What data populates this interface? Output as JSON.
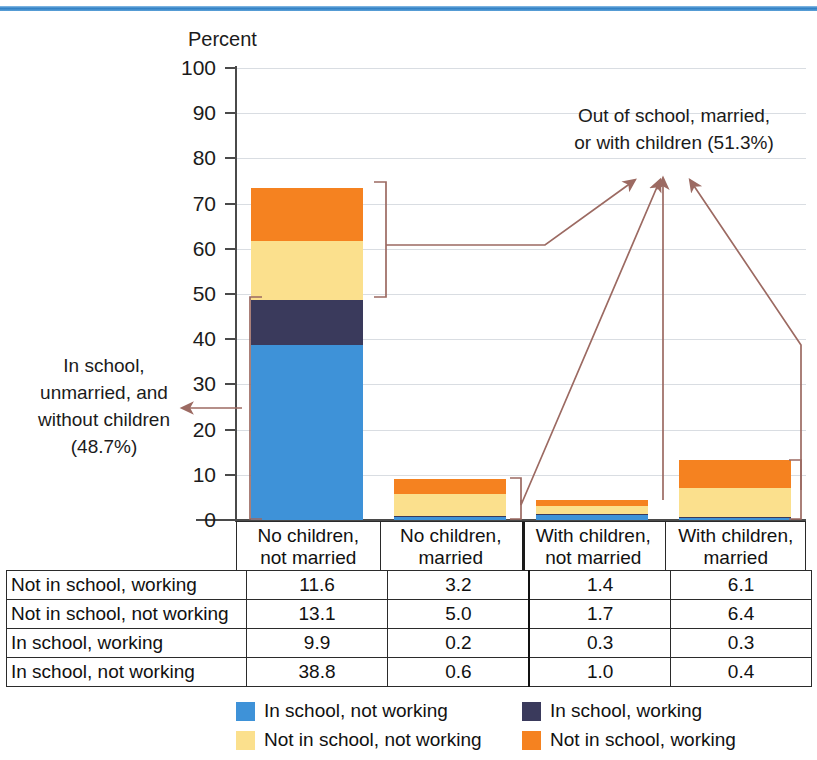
{
  "chart_data": {
    "type": "bar",
    "subtype": "stacked-bar",
    "title": "",
    "ylabel": "Percent",
    "xlabel": "",
    "ylim": [
      0,
      100
    ],
    "yticks": [
      0,
      10,
      20,
      30,
      40,
      50,
      60,
      70,
      80,
      90,
      100
    ],
    "grid": true,
    "legend_position": "bottom",
    "categories": [
      "No children, not married",
      "No children, married",
      "With children, not married",
      "With children, married"
    ],
    "series": [
      {
        "name": "In school, not working",
        "color": "#3e92d8",
        "values": [
          38.8,
          0.6,
          1.0,
          0.4
        ]
      },
      {
        "name": "In school, working",
        "color": "#3a3a5c",
        "values": [
          9.9,
          0.2,
          0.3,
          0.3
        ]
      },
      {
        "name": "Not in school, not working",
        "color": "#fbe08d",
        "values": [
          13.1,
          5.0,
          1.7,
          6.4
        ]
      },
      {
        "name": "Not in school, working",
        "color": "#f58220",
        "values": [
          11.6,
          3.2,
          1.4,
          6.1
        ]
      }
    ],
    "totals": [
      73.4,
      9.0,
      4.4,
      13.2
    ],
    "annotations": [
      "In school, unmarried, and without children (48.7%)",
      "Out of school, married, or with children (51.3%)"
    ]
  },
  "axis": {
    "title": "Percent",
    "ticks": [
      "100",
      "90",
      "80",
      "70",
      "60",
      "50",
      "40",
      "30",
      "20",
      "10",
      "0"
    ]
  },
  "categories": [
    {
      "line1": "No children,",
      "line2": "not married"
    },
    {
      "line1": "No children,",
      "line2": "married"
    },
    {
      "line1": "With children,",
      "line2": "not married"
    },
    {
      "line1": "With children,",
      "line2": "married"
    }
  ],
  "annotations": {
    "left": {
      "line1": "In school,",
      "line2": "unmarried, and",
      "line3": "without children",
      "line4": "(48.7%)"
    },
    "right": {
      "line1": "Out of school, married,",
      "line2": "or with children (51.3%)"
    }
  },
  "table": {
    "rows": [
      {
        "label": "Not in school, working",
        "values": [
          "11.6",
          "3.2",
          "1.4",
          "6.1"
        ]
      },
      {
        "label": "Not in school, not working",
        "values": [
          "13.1",
          "5.0",
          "1.7",
          "6.4"
        ]
      },
      {
        "label": "In school, working",
        "values": [
          "9.9",
          "0.2",
          "0.3",
          "0.3"
        ]
      },
      {
        "label": "In school, not working",
        "values": [
          "38.8",
          "0.6",
          "1.0",
          "0.4"
        ]
      }
    ]
  },
  "legend": {
    "items": [
      {
        "label": "In school, not working",
        "color": "#3e92d8"
      },
      {
        "label": "In school, working",
        "color": "#3a3a5c"
      },
      {
        "label": "Not in school, not working",
        "color": "#fbe08d"
      },
      {
        "label": "Not in school, working",
        "color": "#f58220"
      }
    ]
  },
  "colors": {
    "in_school_not_working": "#3e92d8",
    "in_school_working": "#3a3a5c",
    "not_in_school_not_working": "#fbe08d",
    "not_in_school_working": "#f58220",
    "leader": "#9c6a62",
    "top_rule": "#2f7fc4"
  }
}
